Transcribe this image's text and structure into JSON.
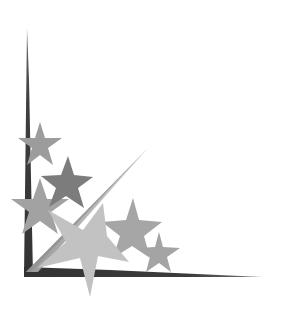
{
  "image": {
    "kind": "decorative-corner-ornament",
    "description": "Grayscale shooting-star corner border",
    "background_color": "#ffffff",
    "colors": {
      "spike_dark": "#3a3a3a",
      "spike_dark_edge": "#555555",
      "diagonal_light": "#b8b8b8",
      "diagonal_shadow": "#8a8a8a",
      "star_mid": "#9a9a9a",
      "star_dark": "#7a7a7a",
      "star_light": "#c4c4c4",
      "star_medium_light": "#a8a8a8"
    }
  }
}
